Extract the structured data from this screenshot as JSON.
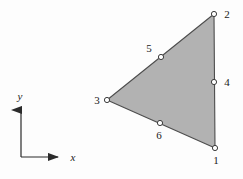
{
  "figure": {
    "type": "finite-element-diagram",
    "background_color": "#fdfdfd",
    "element": {
      "name": "triangular-element",
      "fill_color": "#b2b2b2",
      "edge_color": "#4d4d4d",
      "edge_width": 1.1,
      "corner_nodes": [
        "1",
        "2",
        "3"
      ],
      "midside_nodes": [
        "4",
        "5",
        "6"
      ]
    },
    "nodes": [
      {
        "id": "1",
        "label": "1",
        "type": "corner",
        "x": 215,
        "y": 148,
        "label_x": 216,
        "label_y": 164,
        "label_anchor": "middle"
      },
      {
        "id": "2",
        "label": "2",
        "type": "corner",
        "x": 214,
        "y": 14,
        "label_x": 227,
        "label_y": 18,
        "label_anchor": "middle"
      },
      {
        "id": "3",
        "label": "3",
        "type": "corner",
        "x": 107,
        "y": 100,
        "label_x": 97,
        "label_y": 104,
        "label_anchor": "middle"
      },
      {
        "id": "4",
        "label": "4",
        "type": "midside",
        "x": 214,
        "y": 82,
        "label_x": 227,
        "label_y": 86,
        "label_anchor": "middle"
      },
      {
        "id": "5",
        "label": "5",
        "type": "midside",
        "x": 161,
        "y": 57,
        "label_x": 149,
        "label_y": 52,
        "label_anchor": "middle"
      },
      {
        "id": "6",
        "label": "6",
        "type": "midside",
        "x": 160,
        "y": 123,
        "label_x": 159,
        "label_y": 139,
        "label_anchor": "middle"
      }
    ],
    "node_marker": {
      "radius": 2.6,
      "fill_color": "#ffffff",
      "stroke_color": "#3b3b3b",
      "stroke_width": 1.0
    },
    "axes": {
      "origin_x": 21,
      "origin_y": 157,
      "y_tip_x": 21,
      "y_tip_y": 104,
      "x_tip_x": 64,
      "x_tip_y": 157,
      "stroke_color": "#2b2b2b",
      "stroke_width": 1.2,
      "x_label": "x",
      "y_label": "y",
      "x_label_x": 73,
      "x_label_y": 161,
      "y_label_x": 20,
      "y_label_y": 100
    }
  }
}
